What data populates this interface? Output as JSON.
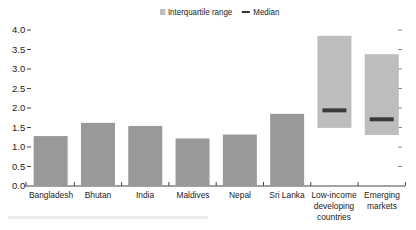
{
  "chart_data": {
    "type": "bar",
    "title": "",
    "xlabel": "",
    "ylabel": "",
    "ylim": [
      0,
      4.0
    ],
    "yticks": [
      0.0,
      0.5,
      1.0,
      1.5,
      2.0,
      2.5,
      3.0,
      3.5,
      4.0
    ],
    "ytick_labels": [
      "0.0",
      "0.5",
      "1.0",
      "1.5",
      "2.0",
      "2.5",
      "3.0",
      "3.5",
      "4.0"
    ],
    "right_axis_ticks": true,
    "grid": false,
    "legend_position": "top",
    "legend": [
      "Interquartile range",
      "Median"
    ],
    "categories": [
      "Bangladesh",
      "Bhutan",
      "India",
      "Maldives",
      "Nepal",
      "Sri Lanka",
      "Low-income developing countries",
      "Emerging markets"
    ],
    "category_labels": [
      [
        "Bangladesh"
      ],
      [
        "Bhutan"
      ],
      [
        "India"
      ],
      [
        "Maldives"
      ],
      [
        "Nepal"
      ],
      [
        "Sri Lanka"
      ],
      [
        "Low-income",
        "developing",
        "countries"
      ],
      [
        "Emerging",
        "markets"
      ]
    ],
    "series": [
      {
        "name": "Country value",
        "type": "bar",
        "values": [
          1.28,
          1.62,
          1.54,
          1.22,
          1.32,
          1.85,
          null,
          null
        ],
        "color": "#999999"
      },
      {
        "name": "Interquartile range",
        "type": "range",
        "low": [
          null,
          null,
          null,
          null,
          null,
          null,
          1.49,
          1.31
        ],
        "high": [
          null,
          null,
          null,
          null,
          null,
          null,
          3.85,
          3.38
        ],
        "color": "#bdbdbd"
      },
      {
        "name": "Median",
        "type": "marker",
        "values": [
          null,
          null,
          null,
          null,
          null,
          null,
          1.94,
          1.71
        ],
        "color": "#333333"
      }
    ]
  },
  "legend": {
    "iqr_label": "Interquartile range",
    "median_label": "Median"
  },
  "colors": {
    "bar": "#999999",
    "iqr": "#bdbdbd",
    "median": "#3a3a3a",
    "axis": "#444444",
    "text": "#222222"
  }
}
